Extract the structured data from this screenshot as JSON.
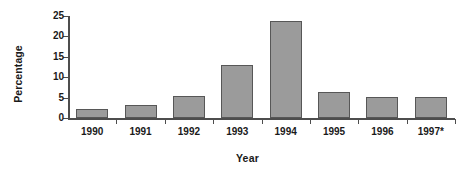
{
  "chart_data": {
    "type": "bar",
    "title": "",
    "xlabel": "Year",
    "ylabel": "Percentage",
    "categories": [
      "1990",
      "1991",
      "1992",
      "1993",
      "1994",
      "1995",
      "1996",
      "1997*"
    ],
    "values": [
      2.1,
      3.1,
      5.4,
      13.0,
      23.9,
      6.4,
      5.1,
      5.1
    ],
    "ylim": [
      0,
      25
    ],
    "yticks": [
      0,
      5,
      10,
      15,
      20,
      25
    ],
    "ytick_labels": [
      "0",
      "5",
      "10",
      "15",
      "20",
      "25"
    ],
    "grid": false,
    "legend": null,
    "legend_position": "none",
    "bar_fill_color": "#9b9b9b",
    "bar_border_color": "#575757",
    "axis_color": "#4d4d4d",
    "text_color": "#1a1a1a",
    "background_color": "#ffffff",
    "footnote_marker": "*"
  }
}
